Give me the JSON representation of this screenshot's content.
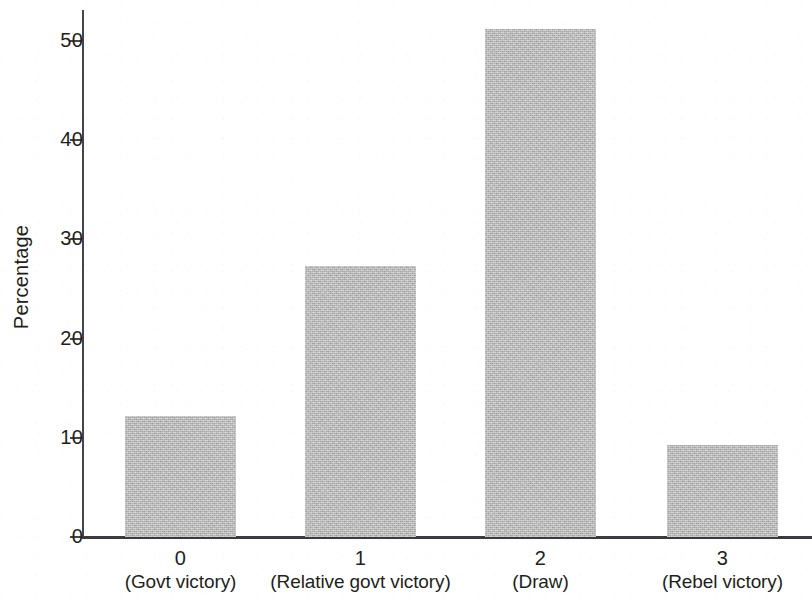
{
  "chart_data": {
    "type": "bar",
    "title": "",
    "subtitle": "",
    "xlabel": "",
    "ylabel": "Percentage",
    "categories": [
      "0",
      "1",
      "2",
      "3"
    ],
    "category_captions": [
      "(Govt victory)",
      "(Relative govt victory)",
      "(Draw)",
      "(Rebel victory)"
    ],
    "values": [
      12.2,
      27.3,
      51.2,
      9.3
    ],
    "ylim": [
      0,
      53
    ],
    "ytick_labels": [
      "0",
      "10",
      "20",
      "30",
      "40",
      "50"
    ],
    "ytick_values": [
      0,
      10,
      20,
      30,
      40,
      50
    ],
    "grid": false,
    "legend": null,
    "legend_position": "none",
    "bar_color": "#b9b9b9",
    "axis_color": "#3b3b3f",
    "text_color": "#231f20",
    "background_color": "#ffffff"
  },
  "axes": {
    "y_title": "Percentage"
  },
  "bars": [
    {
      "label": "0",
      "caption": "(Govt victory)",
      "value": 12.2
    },
    {
      "label": "1",
      "caption": "(Relative govt victory)",
      "value": 27.3
    },
    {
      "label": "2",
      "caption": "(Draw)",
      "value": 51.2
    },
    {
      "label": "3",
      "caption": "(Rebel victory)",
      "value": 9.3
    }
  ],
  "yticks": [
    {
      "label": "50",
      "value": 50
    },
    {
      "label": "40",
      "value": 40
    },
    {
      "label": "30",
      "value": 30
    },
    {
      "label": "20",
      "value": 20
    },
    {
      "label": "10",
      "value": 10
    },
    {
      "label": "0",
      "value": 0
    }
  ]
}
